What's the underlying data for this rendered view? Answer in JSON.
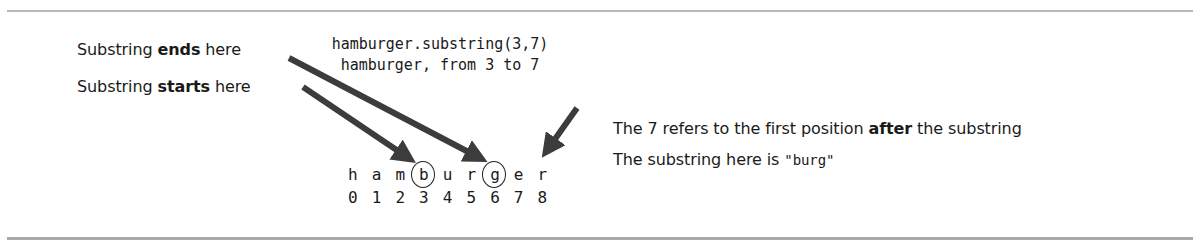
{
  "diagram": {
    "labels": {
      "ends": {
        "prefix": "Substring ",
        "bold": "ends",
        "suffix": " here"
      },
      "starts": {
        "prefix": "Substring ",
        "bold": "starts",
        "suffix": " here"
      }
    },
    "code": {
      "line1": "hamburger.substring(3,7)",
      "line2": "hamburger, from 3 to 7"
    },
    "string": {
      "chars": [
        "h",
        "a",
        "m",
        "b",
        "u",
        "r",
        "g",
        "e",
        "r"
      ],
      "indices": [
        "0",
        "1",
        "2",
        "3",
        "4",
        "5",
        "6",
        "7",
        "8"
      ],
      "circled_indices": [
        3,
        6
      ]
    },
    "notes": {
      "line1": {
        "prefix": "The 7 refers to the first position ",
        "bold": "after",
        "suffix": " the substring"
      },
      "line2": {
        "prefix": "The substring here is ",
        "quoted": "\"burg\""
      }
    },
    "arrows": [
      {
        "name": "ends-arrow",
        "from": "Substring ends here",
        "to_index": 6
      },
      {
        "name": "starts-arrow",
        "from": "Substring starts here",
        "to_index": 3
      },
      {
        "name": "end-exclusive-arrow",
        "from": "7",
        "to_index": 7
      }
    ],
    "colors": {
      "text": "#1a1a1a",
      "arrow": "#3c3c3c",
      "rule": "#b8b8b8"
    }
  }
}
